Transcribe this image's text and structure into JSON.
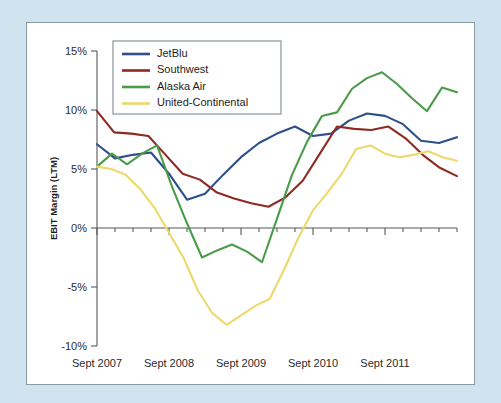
{
  "figure": {
    "background_color": "#cfe4ef",
    "panel_color": "#ffffff",
    "panel_border_color": "#8a9aa6"
  },
  "chart_data": {
    "type": "line",
    "title": "",
    "subtitle": "",
    "xlabel": "",
    "ylabel": "EBIT Margin (LTM)",
    "ylim": [
      -10,
      15
    ],
    "ytick_values": [
      15,
      10,
      5,
      0,
      -5,
      -10
    ],
    "ytick_labels": [
      "15%",
      "10%",
      "5%",
      "0%",
      "-5%",
      "-10%"
    ],
    "xtick_labels": [
      "Sept 2007",
      "Sept 2008",
      "Sept 2009",
      "Sept 2010",
      "Sept 2011"
    ],
    "xtick_positions": [
      0,
      4,
      8,
      12,
      16
    ],
    "x_minor_tick_count": 20,
    "x_index_range": [
      0,
      19
    ],
    "grid": false,
    "zero_line": true,
    "legend_position": "top-left",
    "series": [
      {
        "name": "JetBlu",
        "color": "#2d4f8a",
        "values": [
          7.1,
          5.9,
          6.2,
          6.4,
          4.6,
          2.4,
          2.9,
          4.5,
          6.0,
          7.2,
          8.0,
          8.6,
          7.8,
          8.0,
          9.1,
          9.7,
          9.5,
          8.8,
          7.4,
          7.2,
          7.7
        ]
      },
      {
        "name": "Southwest",
        "color": "#8e2a22",
        "values": [
          9.9,
          8.1,
          8.0,
          7.8,
          6.2,
          4.6,
          4.1,
          3.0,
          2.5,
          2.1,
          1.8,
          2.6,
          4.0,
          6.3,
          8.6,
          8.4,
          8.3,
          8.6,
          7.6,
          6.2,
          5.1,
          4.4
        ]
      },
      {
        "name": "Alaska Air",
        "color": "#4a9c4a",
        "values": [
          5.2,
          6.3,
          5.4,
          6.3,
          7.0,
          3.5,
          0.4,
          -2.5,
          -1.9,
          -1.4,
          -2.0,
          -2.9,
          0.8,
          4.5,
          7.3,
          9.5,
          9.8,
          11.8,
          12.7,
          13.2,
          12.2,
          11.0,
          9.9,
          11.9,
          11.5
        ]
      },
      {
        "name": "United-Continental",
        "color": "#edd96a",
        "values": [
          5.2,
          5.0,
          4.5,
          3.3,
          1.7,
          -0.4,
          -2.5,
          -5.3,
          -7.2,
          -8.2,
          -7.4,
          -6.6,
          -6.0,
          -3.5,
          -0.8,
          1.5,
          3.0,
          4.6,
          6.7,
          7.0,
          6.3,
          6.0,
          6.2,
          6.5,
          6.0,
          5.7
        ]
      }
    ]
  },
  "legend": {
    "items": [
      {
        "label": "JetBlu",
        "color": "#2d4f8a"
      },
      {
        "label": "Southwest",
        "color": "#8e2a22"
      },
      {
        "label": "Alaska Air",
        "color": "#4a9c4a"
      },
      {
        "label": "United-Continental",
        "color": "#edd96a"
      }
    ]
  }
}
